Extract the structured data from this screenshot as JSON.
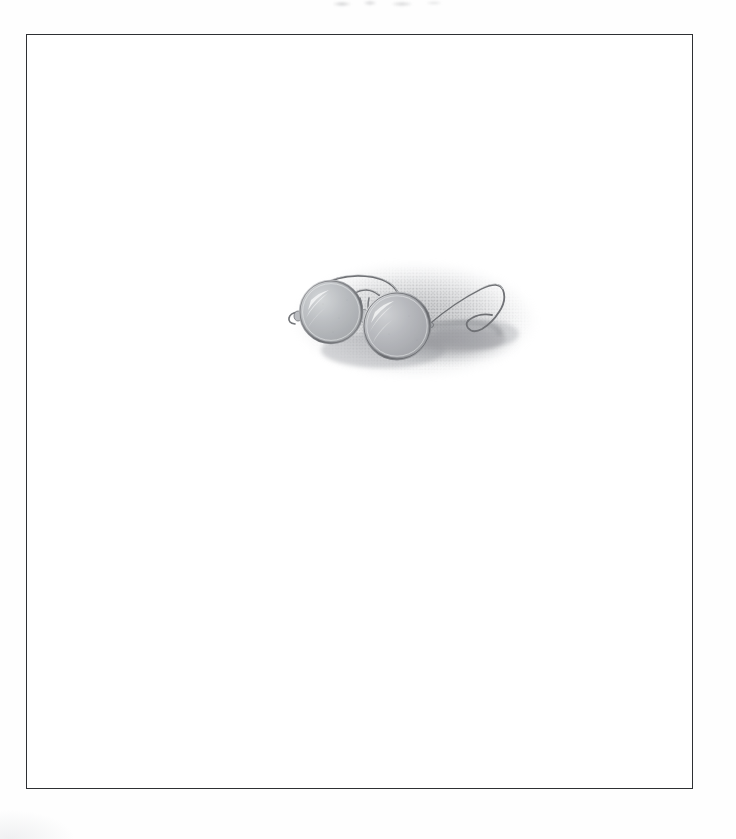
{
  "page": {
    "medium": "graphite pencil drawing, scanned",
    "background_color": "#ffffff",
    "paper_color": "#fefefe"
  },
  "plate": {
    "border_color": "#2e3033",
    "border_width_px": 1.4,
    "left_px": 26,
    "top_px": 34,
    "width_px": 667,
    "height_px": 755,
    "fill_color": "#ffffff"
  },
  "artwork": {
    "name": "round wire-rim eyeglasses",
    "description": "A pair of antique round wire-rimmed spectacles resting open, drawn in graphite with a soft stippled shadow halo and a cast shadow falling to the right.",
    "left_px": 236,
    "top_px": 203,
    "width_px": 300,
    "height_px": 155,
    "parts": [
      {
        "name": "left-lens",
        "shape": "circle",
        "cx": 68,
        "cy": 74,
        "r": 31
      },
      {
        "name": "right-lens",
        "shape": "circle",
        "cx": 134,
        "cy": 88,
        "r": 33
      },
      {
        "name": "bridge",
        "shape": "arch"
      },
      {
        "name": "left-temple-arm",
        "shape": "wire"
      },
      {
        "name": "right-temple-arm",
        "shape": "wire-with-hook-end"
      },
      {
        "name": "left-endpiece-hinge",
        "shape": "small-loop"
      },
      {
        "name": "cast-shadow",
        "shape": "ellipse"
      }
    ],
    "colors": {
      "frame_wire": "#8d8f93",
      "frame_highlight": "#e9eaec",
      "lens_fill": "#b9bbbf",
      "lens_highlight": "#f1f2f3",
      "shadow_mid": "#9a9ca0",
      "halo_soft": "#c8cacd"
    }
  },
  "artifacts": {
    "top_edge_smudge": "faint gray scanning smudge across the top margin",
    "bottom_left_tone": "very faint paper tone at lower-left outside the plate"
  }
}
